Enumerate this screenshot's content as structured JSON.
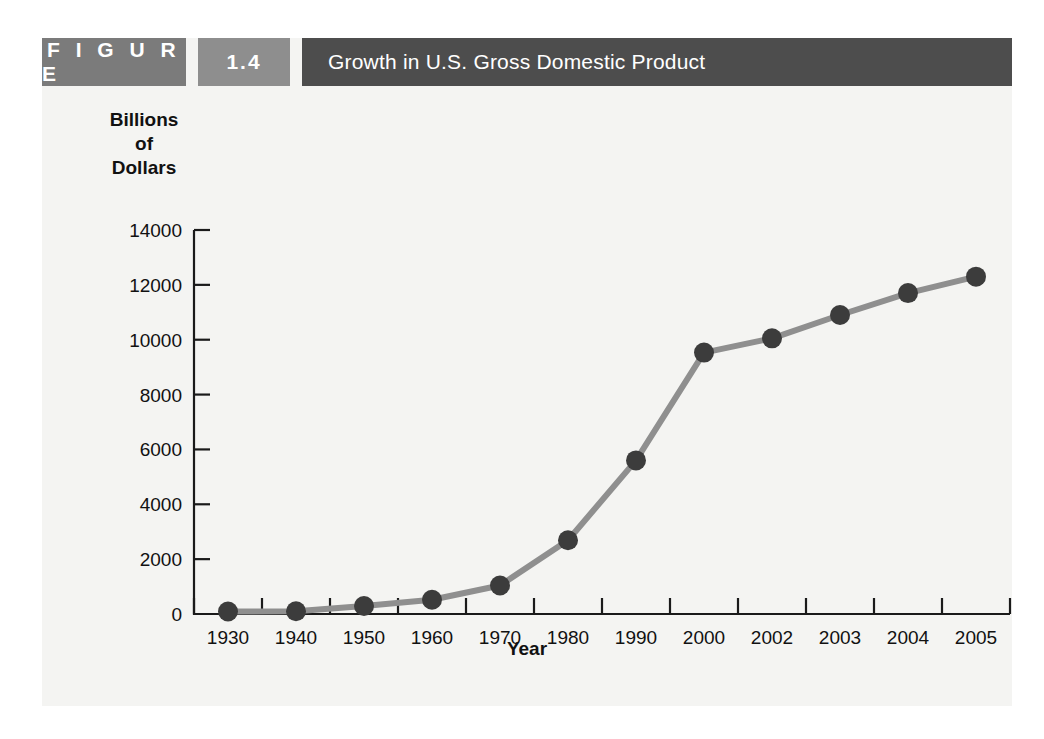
{
  "figure": {
    "label": "F I G U R E",
    "number": "1.4",
    "title": "Growth in U.S. Gross Domestic Product",
    "colors": {
      "label_block": "#7b7b7b",
      "number_block": "#8e8e8e",
      "title_block": "#4d4d4d",
      "panel_background": "#f4f4f2",
      "line": "#8f8f8f",
      "marker": "#3c3c3c",
      "axis": "#1a1a1a"
    }
  },
  "chart_data": {
    "type": "line",
    "title": "Growth in U.S. Gross Domestic Product",
    "xlabel": "Year",
    "ylabel": "Billions\nof\nDollars",
    "categories": [
      "1930",
      "1940",
      "1950",
      "1960",
      "1970",
      "1980",
      "1990",
      "2000",
      "2002",
      "2003",
      "2004",
      "2005"
    ],
    "values": [
      90,
      100,
      290,
      520,
      1040,
      2690,
      5600,
      9530,
      10050,
      10900,
      11700,
      12300
    ],
    "ytick_labels": [
      "0",
      "2000",
      "4000",
      "6000",
      "8000",
      "10000",
      "12000",
      "14000"
    ],
    "yticks": [
      0,
      2000,
      4000,
      6000,
      8000,
      10000,
      12000,
      14000
    ],
    "ylim": [
      0,
      14000
    ],
    "grid": false,
    "legend": null,
    "markers": true
  }
}
